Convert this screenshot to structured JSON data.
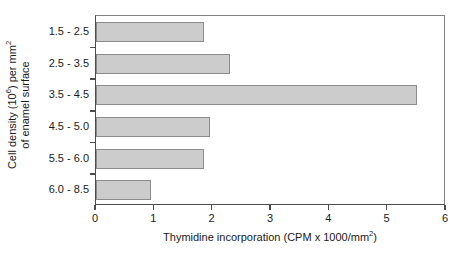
{
  "chart_data": {
    "type": "bar",
    "orientation": "horizontal",
    "title": "",
    "xlabel": "Thymidine incorporation (CPM x 1000/mm2)",
    "xlabel_parts": {
      "before_sup": "Thymidine incorporation (CPM x 1000/mm",
      "sup": "2",
      "after_sup": ")"
    },
    "ylabel": "Cell density (106) per mm2 of enamel surface",
    "ylabel_lines": [
      {
        "before_sup": "Cell density (10",
        "sup": "6",
        "mid": ") per mm",
        "sup2": "2",
        "after": ""
      },
      {
        "text": "of enamel surface"
      }
    ],
    "categories": [
      "1.5 - 2.5",
      "2.5 - 3.5",
      "3.5 - 4.5",
      "4.5 - 5.0",
      "5.5 - 6.0",
      "6.0 - 8.5"
    ],
    "values": [
      1.85,
      2.3,
      5.5,
      1.95,
      1.85,
      0.95
    ],
    "xlim": [
      0,
      6
    ],
    "xticks": [
      "0",
      "1",
      "2",
      "3",
      "4",
      "5",
      "6"
    ],
    "xtick_values": [
      0,
      1,
      2,
      3,
      4,
      5,
      6
    ],
    "grid": false,
    "legend": false,
    "bar_fill_color": "#cccccc",
    "bar_border_color": "#8c8c8c",
    "axis_color": "#4d4d4d",
    "text_color": "#1a1a1a",
    "background_color": "#ffffff"
  }
}
